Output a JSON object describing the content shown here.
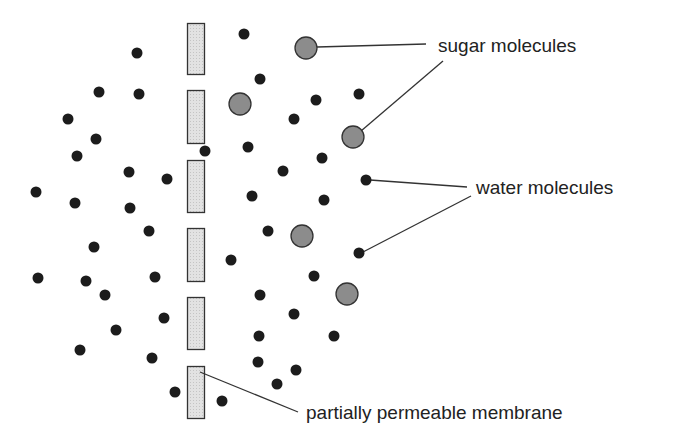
{
  "colors": {
    "water": "#1c1c1c",
    "sugar_fill": "#8c8c8c",
    "sugar_stroke": "#333333",
    "membrane_fill": "#dcdcdc",
    "membrane_stroke": "#333333",
    "leader": "#333333"
  },
  "labels": {
    "sugar": "sugar molecules",
    "water": "water molecules",
    "membrane": "partially permeable membrane"
  },
  "membrane_segments": [
    {
      "x": 187,
      "y": 23,
      "w": 17,
      "h": 51
    },
    {
      "x": 187,
      "y": 90,
      "w": 17,
      "h": 53
    },
    {
      "x": 187,
      "y": 160,
      "w": 17,
      "h": 52
    },
    {
      "x": 187,
      "y": 228,
      "w": 17,
      "h": 53
    },
    {
      "x": 187,
      "y": 297,
      "w": 17,
      "h": 52
    },
    {
      "x": 187,
      "y": 366,
      "w": 17,
      "h": 52
    }
  ],
  "water_molecules": [
    [
      137,
      53
    ],
    [
      99,
      92
    ],
    [
      139,
      94
    ],
    [
      68,
      119
    ],
    [
      96,
      139
    ],
    [
      77,
      156
    ],
    [
      129,
      172
    ],
    [
      167,
      179
    ],
    [
      36,
      192
    ],
    [
      75,
      203
    ],
    [
      130,
      208
    ],
    [
      205,
      151
    ],
    [
      149,
      231
    ],
    [
      94,
      247
    ],
    [
      38,
      278
    ],
    [
      86,
      281
    ],
    [
      155,
      277
    ],
    [
      105,
      295
    ],
    [
      164,
      318
    ],
    [
      116,
      330
    ],
    [
      80,
      350
    ],
    [
      152,
      358
    ],
    [
      175,
      392
    ],
    [
      244,
      34
    ],
    [
      260,
      79
    ],
    [
      316,
      100
    ],
    [
      359,
      94
    ],
    [
      294,
      119
    ],
    [
      248,
      147
    ],
    [
      322,
      158
    ],
    [
      283,
      171
    ],
    [
      366,
      180
    ],
    [
      252,
      196
    ],
    [
      324,
      200
    ],
    [
      268,
      231
    ],
    [
      231,
      260
    ],
    [
      359,
      253
    ],
    [
      314,
      276
    ],
    [
      260,
      295
    ],
    [
      294,
      314
    ],
    [
      259,
      336
    ],
    [
      334,
      336
    ],
    [
      258,
      362
    ],
    [
      296,
      370
    ],
    [
      277,
      384
    ],
    [
      222,
      401
    ]
  ],
  "sugar_molecules": [
    [
      306,
      48
    ],
    [
      240,
      104
    ],
    [
      353,
      137
    ],
    [
      302,
      236
    ],
    [
      347,
      294
    ]
  ],
  "leaders": [
    {
      "x1": 317,
      "y1": 47,
      "x2": 426,
      "y2": 44
    },
    {
      "x1": 361,
      "y1": 131,
      "x2": 443,
      "y2": 61
    },
    {
      "x1": 370,
      "y1": 180,
      "x2": 467,
      "y2": 187
    },
    {
      "x1": 363,
      "y1": 252,
      "x2": 471,
      "y2": 196
    },
    {
      "x1": 200,
      "y1": 372,
      "x2": 298,
      "y2": 412
    }
  ],
  "label_positions": {
    "sugar": {
      "x": 438,
      "y": 52
    },
    "water": {
      "x": 476,
      "y": 194
    },
    "membrane": {
      "x": 306,
      "y": 419
    }
  }
}
